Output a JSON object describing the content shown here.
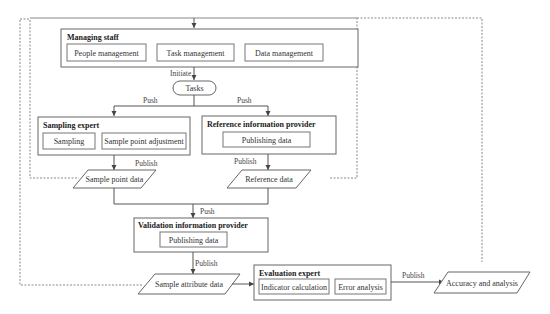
{
  "diagram": {
    "type": "flowchart",
    "roles": {
      "managing_staff": {
        "title": "Managing staff",
        "items": [
          "People management",
          "Task management",
          "Data management"
        ]
      },
      "sampling_expert": {
        "title": "Sampling expert",
        "items": [
          "Sampling",
          "Sample point adjustment"
        ]
      },
      "reference_provider": {
        "title": "Reference information provider",
        "items": [
          "Publishing data"
        ]
      },
      "validation_provider": {
        "title": "Validation information provider",
        "items": [
          "Publishing data"
        ]
      },
      "evaluation_expert": {
        "title": "Evaluation expert",
        "items": [
          "Indicator calculation",
          "Error analysis"
        ]
      }
    },
    "terminal": {
      "tasks": "Tasks"
    },
    "data_nodes": {
      "sample_point_data": "Sample point data",
      "reference_data": "Reference data",
      "sample_attribute_data": "Sample attribute data",
      "accuracy_analysis": "Accuracy and analysis"
    },
    "edge_labels": {
      "initiate": "Initiate",
      "push_left": "Push",
      "push_right": "Push",
      "publish_sampling": "Publish",
      "publish_reference": "Publish",
      "push_validation": "Push",
      "publish_validation": "Publish",
      "publish_evaluation": "Publish"
    },
    "colors": {
      "line": "#555555",
      "dashed": "#888888",
      "text": "#333333"
    }
  }
}
